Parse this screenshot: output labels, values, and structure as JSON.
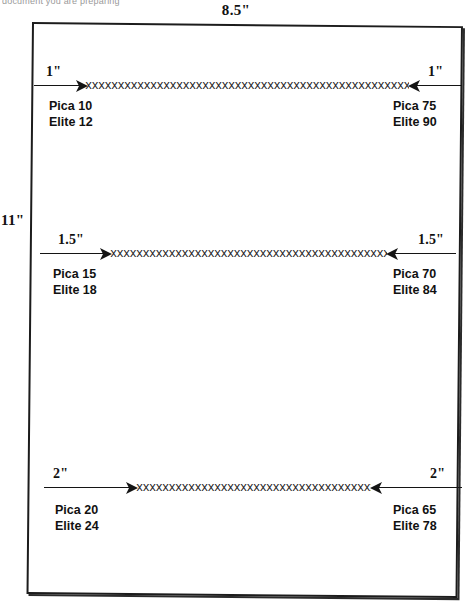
{
  "scan": {
    "clipped_header_text": "document you are preparing"
  },
  "page": {
    "width_label": "8.5\"",
    "height_label": "11\""
  },
  "rows": [
    {
      "id": "row-1-inch",
      "left": {
        "inch_label": "1\"",
        "pica_label": "Pica 10",
        "elite_label": "Elite 12"
      },
      "right": {
        "inch_label": "1\"",
        "pica_label": "Pica 75",
        "elite_label": "Elite 90"
      },
      "fill_char": "x",
      "fill_count": 62
    },
    {
      "id": "row-1-5-inch",
      "left": {
        "inch_label": "1.5\"",
        "pica_label": "Pica 15",
        "elite_label": "Elite 18"
      },
      "right": {
        "inch_label": "1.5\"",
        "pica_label": "Pica 70",
        "elite_label": "Elite 84"
      },
      "fill_char": "x",
      "fill_count": 53
    },
    {
      "id": "row-2-inch",
      "left": {
        "inch_label": "2\"",
        "pica_label": "Pica 20",
        "elite_label": "Elite 24"
      },
      "right": {
        "inch_label": "2\"",
        "pica_label": "Pica 65",
        "elite_label": "Elite 78"
      },
      "fill_char": "x",
      "fill_count": 45
    }
  ],
  "colors": {
    "ink": "#111111",
    "sheet_border": "#1c1c1c",
    "paper": "#ffffff"
  }
}
